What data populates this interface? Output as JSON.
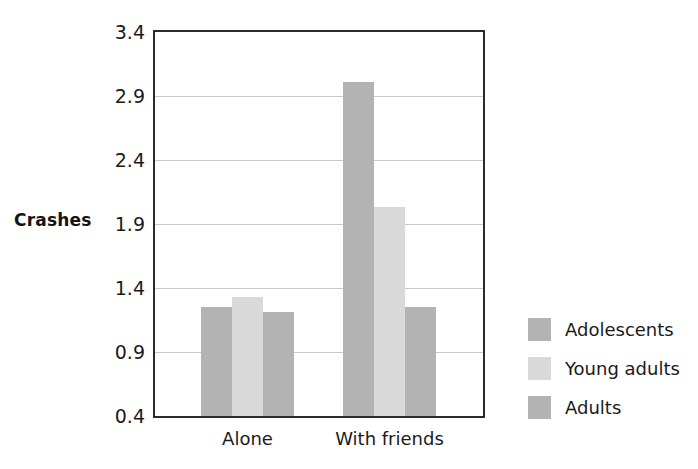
{
  "chart_data": {
    "type": "bar",
    "title": "",
    "subtitle": "",
    "xlabel": "",
    "ylabel": "Crashes",
    "categories": [
      "Alone",
      "With friends"
    ],
    "series": [
      {
        "name": "Adolescents",
        "values": [
          1.25,
          3.01
        ],
        "color": "#b3b3b3"
      },
      {
        "name": "Young adults",
        "values": [
          1.33,
          2.03
        ],
        "color": "#d9d9d9"
      },
      {
        "name": "Adults",
        "values": [
          1.21,
          1.25
        ],
        "color": "#b3b3b3"
      }
    ],
    "ylim": [
      0.4,
      3.4
    ],
    "yticks": [
      "0.4",
      "0.9",
      "1.4",
      "1.9",
      "2.4",
      "2.9",
      "3.4"
    ],
    "ytick_values": [
      0.4,
      0.9,
      1.4,
      1.9,
      2.4,
      2.9,
      3.4
    ],
    "grid": true,
    "grid_axis": "y",
    "legend_position": "right",
    "frame_color": "#2b2b2b",
    "grid_color": "#c9c9c9",
    "background": "#ffffff"
  },
  "legend": {
    "items": [
      {
        "label": "Adolescents",
        "color": "#b3b3b3"
      },
      {
        "label": "Young adults",
        "color": "#d9d9d9"
      },
      {
        "label": "Adults",
        "color": "#b3b3b3"
      }
    ]
  }
}
